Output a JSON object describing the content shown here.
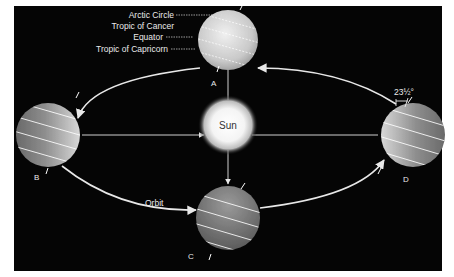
{
  "diagram": {
    "title_hidden": "Earth's orbit around the Sun showing seasons",
    "colors": {
      "background": "#050505",
      "page": "#ffffff",
      "orbit": "#e8e8e8",
      "text": "#eaeaea",
      "sun_core": "#ffffff",
      "globe_light": "#d9d9d9",
      "globe_dark": "#5a5a5a"
    },
    "sun": {
      "label": "Sun"
    },
    "orbit_label": "Orbit",
    "tilt_label": "23½°",
    "latitude_labels": {
      "arctic_circle": "Arctic Circle",
      "tropic_of_cancer": "Tropic of Cancer",
      "equator": "Equator",
      "tropic_of_capricorn": "Tropic of Capricorn"
    },
    "positions": [
      {
        "id": "A",
        "label": "A"
      },
      {
        "id": "B",
        "label": "B"
      },
      {
        "id": "C",
        "label": "C"
      },
      {
        "id": "D",
        "label": "D"
      }
    ]
  }
}
